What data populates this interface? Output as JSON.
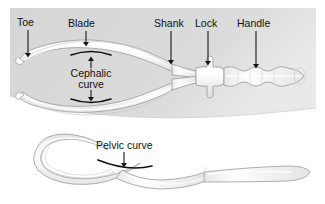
{
  "figure": {
    "background_color": "#ffffff",
    "panel_color": "#d8d8d8",
    "instrument_fill": "#fbfbfb",
    "instrument_shade": "#d9d9d9",
    "outline_color": "#9a9a9a",
    "arrow_color": "#161616",
    "text_color": "#111111"
  },
  "labels": {
    "toe": "Toe",
    "blade": "Blade",
    "shank": "Shank",
    "lock": "Lock",
    "handle": "Handle",
    "cephalic_curve_line1": "Cephalic",
    "cephalic_curve_line2": "curve",
    "pelvic_curve": "Pelvic curve"
  },
  "views": {
    "top_view": {
      "name": "superior view of assembled forceps",
      "parts": [
        "Toe",
        "Blade",
        "Cephalic curve",
        "Shank",
        "Lock",
        "Handle"
      ]
    },
    "side_view": {
      "name": "lateral view of single forceps branch",
      "parts": [
        "Pelvic curve"
      ]
    }
  },
  "annotations": [
    {
      "label": "Toe",
      "kind": "arrow",
      "direction": "down"
    },
    {
      "label": "Blade",
      "kind": "arrow",
      "direction": "down"
    },
    {
      "label": "Shank",
      "kind": "arrow",
      "direction": "down"
    },
    {
      "label": "Lock",
      "kind": "arrow",
      "direction": "down"
    },
    {
      "label": "Handle",
      "kind": "arrow",
      "direction": "down"
    },
    {
      "label": "Cephalic curve",
      "kind": "bracket-arrows",
      "direction": "up-and-down"
    },
    {
      "label": "Pelvic curve",
      "kind": "arrow",
      "direction": "down"
    }
  ]
}
